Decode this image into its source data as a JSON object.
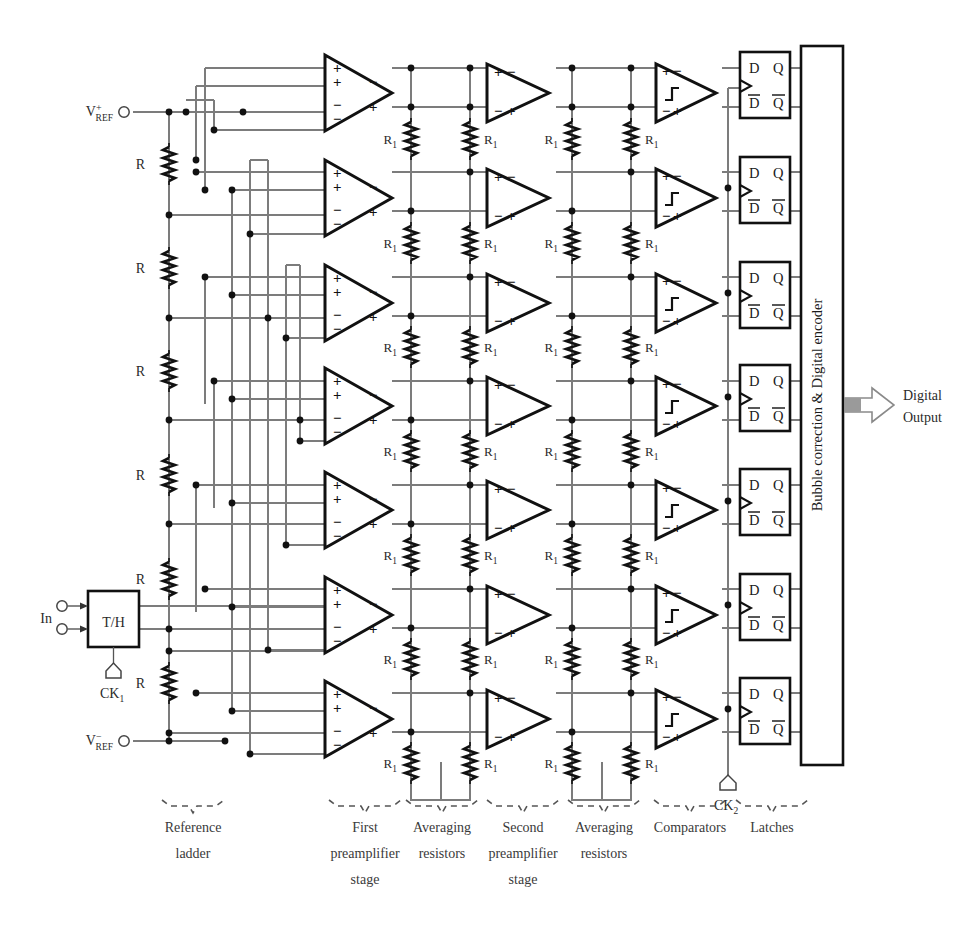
{
  "figure": {
    "type": "block-diagram"
  },
  "signals": {
    "input_label": "In",
    "vref_plus_main": "V",
    "vref_plus_sub": "REF",
    "vref_plus_sup": "+",
    "vref_minus_main": "V",
    "vref_minus_sub": "REF",
    "vref_minus_sup": "−",
    "clock1_main": "CK",
    "clock1_sub": "1",
    "clock2_main": "CK",
    "clock2_sub": "2",
    "digital_output_line1": "Digital",
    "digital_output_line2": "Output"
  },
  "blocks": {
    "track_hold_label": "T/H",
    "encoder_label": "Bubble correction & Digital encoder",
    "ladder_resistor_label": "R",
    "averaging_resistor_main": "R",
    "averaging_resistor_sub": "1",
    "latch_pins": {
      "d": "D",
      "q": "Q",
      "dbar": "D",
      "qbar": "Q"
    },
    "preamp_input_signs": [
      "+",
      "+",
      "−",
      "−"
    ],
    "preamp_output_signs": [
      "−",
      "+"
    ],
    "stage2_input_signs": [
      "+",
      "−"
    ],
    "stage2_output_signs": [
      "−",
      "+"
    ],
    "comparator_input_signs": [
      "+",
      "−"
    ],
    "comparator_output_signs": [
      "−",
      "+"
    ]
  },
  "section_labels": [
    {
      "id": "reference-ladder",
      "lines": [
        "Reference",
        "ladder"
      ],
      "x": 193,
      "y": 832,
      "bracket": {
        "cx": 193,
        "y": 806,
        "w": 62
      }
    },
    {
      "id": "first-preamplifier-stage",
      "lines": [
        "First",
        "preamplifier",
        "stage"
      ],
      "x": 365,
      "y": 832,
      "bracket": {
        "cx": 365,
        "y": 806,
        "w": 72
      }
    },
    {
      "id": "averaging-resistors-1",
      "lines": [
        "Averaging",
        "resistors"
      ],
      "x": 442,
      "y": 832,
      "bracket": {
        "cx": 442,
        "y": 806,
        "w": 72
      }
    },
    {
      "id": "second-preamplifier-stage",
      "lines": [
        "Second",
        "preamplifier",
        "stage"
      ],
      "x": 523,
      "y": 832,
      "bracket": {
        "cx": 523,
        "y": 806,
        "w": 72
      }
    },
    {
      "id": "averaging-resistors-2",
      "lines": [
        "Averaging",
        "resistors"
      ],
      "x": 604,
      "y": 832,
      "bracket": {
        "cx": 604,
        "y": 806,
        "w": 72
      }
    },
    {
      "id": "comparators",
      "lines": [
        "Comparators"
      ],
      "x": 690,
      "y": 832,
      "bracket": {
        "cx": 690,
        "y": 806,
        "w": 72
      }
    },
    {
      "id": "latches",
      "lines": [
        "Latches"
      ],
      "x": 772,
      "y": 832,
      "bracket": {
        "cx": 772,
        "y": 806,
        "w": 72
      }
    }
  ],
  "geometry": {
    "rows": 7,
    "row_tops": [
      55,
      160,
      265,
      368,
      472,
      577,
      681
    ],
    "row_pitch": 104,
    "ladder": {
      "x": 169,
      "top": 112,
      "bottom": 741,
      "taps": 7
    },
    "columns": {
      "preamp1_x": 325,
      "avg1_a_x": 411,
      "avg1_b_x": 470,
      "preamp2_x": 487,
      "avg2_a_x": 572,
      "avg2_b_x": 631,
      "comparator_x": 656,
      "latch_x": 740,
      "encoder_x": 800
    }
  },
  "counts": {
    "preamplifiers_stage1": 7,
    "preamplifiers_stage2": 7,
    "comparators": 7,
    "latches": 7,
    "ladder_resistors": 8,
    "averaging_resistor_columns": 4
  },
  "colors": {
    "ink": "#1a1a1a",
    "wire": "#6b6b6b",
    "wire_dark": "#2b2b2b",
    "arrow_fill": "#9a9a9a",
    "background": "#ffffff"
  }
}
